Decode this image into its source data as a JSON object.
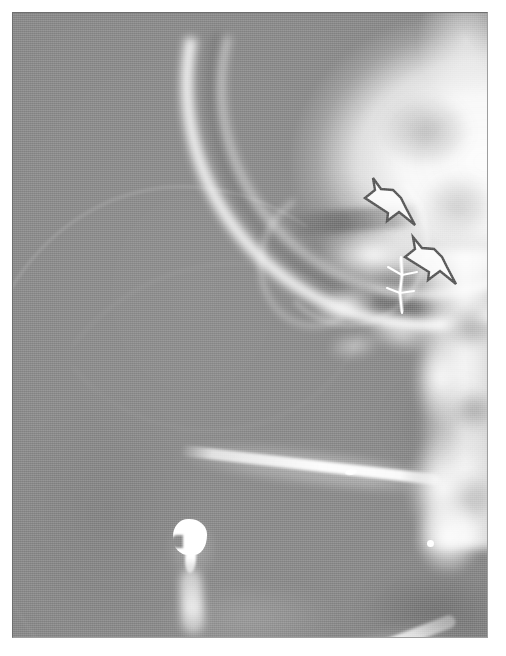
{
  "image": {
    "kind": "radiograph",
    "modality": "X-ray",
    "view": "lateral skull / facial profile",
    "width": 506,
    "height": 656,
    "plate": {
      "x": 12,
      "y": 12,
      "width": 476,
      "height": 626
    },
    "background_hex": "#ffffff",
    "soft_tissue_hex": "#8b8b8b",
    "bone_hex": "#ffffff",
    "annotation_outline_hex": "#5a5a5a",
    "annotation_fill_hex": "#fdfdfd"
  },
  "annotations": [
    {
      "id": "arrow-upper",
      "icon": "block-arrow-icon",
      "label": "",
      "direction": "down-left",
      "x": 350,
      "y": 155,
      "width": 64,
      "height": 60,
      "outline_hex": "#5a5a5a",
      "fill_hex": "#fdfdfd",
      "points_at": "upper lesion / frontal-ethmoid region"
    },
    {
      "id": "arrow-lower",
      "icon": "block-arrow-icon",
      "label": "",
      "direction": "down-left",
      "x": 390,
      "y": 212,
      "width": 66,
      "height": 62,
      "outline_hex": "#5a5a5a",
      "fill_hex": "#fdfdfd",
      "points_at": "lower lesion / posterior nasal region"
    }
  ],
  "features": [
    {
      "id": "cranial-vault",
      "label": "cranial vault",
      "interactable": false
    },
    {
      "id": "frontal-sinus",
      "label": "frontal sinus",
      "interactable": false
    },
    {
      "id": "orbital-rim",
      "label": "orbital rim",
      "interactable": false
    },
    {
      "id": "nasal-dorsum",
      "label": "nasal dorsum",
      "interactable": false
    },
    {
      "id": "maxilla",
      "label": "maxilla",
      "interactable": false
    },
    {
      "id": "cervical-spine",
      "label": "skull base / cervical spine",
      "interactable": false
    },
    {
      "id": "mandible",
      "label": "mandible",
      "interactable": false
    },
    {
      "id": "mandibular-angle",
      "label": "mandibular angle",
      "interactable": false
    },
    {
      "id": "tooth-restoration",
      "label": "radiopaque dental restoration",
      "interactable": false
    },
    {
      "id": "surgical-wire",
      "label": "surgical wire / suture",
      "interactable": false
    },
    {
      "id": "radiopaque-dot-a",
      "label": "radiopaque dot",
      "interactable": false
    },
    {
      "id": "radiopaque-dot-b",
      "label": "radiopaque dot",
      "interactable": false
    }
  ]
}
